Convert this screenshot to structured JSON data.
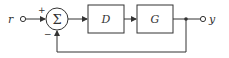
{
  "diagram": {
    "type": "feedback-control-block-diagram",
    "input_label": "r",
    "output_label": "y",
    "summing_junction": {
      "symbol": "Σ",
      "plus_sign": "+",
      "minus_sign": "−"
    },
    "blocks": [
      {
        "id": "controller",
        "label": "D"
      },
      {
        "id": "plant",
        "label": "G"
      }
    ],
    "feedback": "unity negative feedback",
    "colors": {
      "line": "#333333",
      "background": "#ffffff"
    }
  }
}
